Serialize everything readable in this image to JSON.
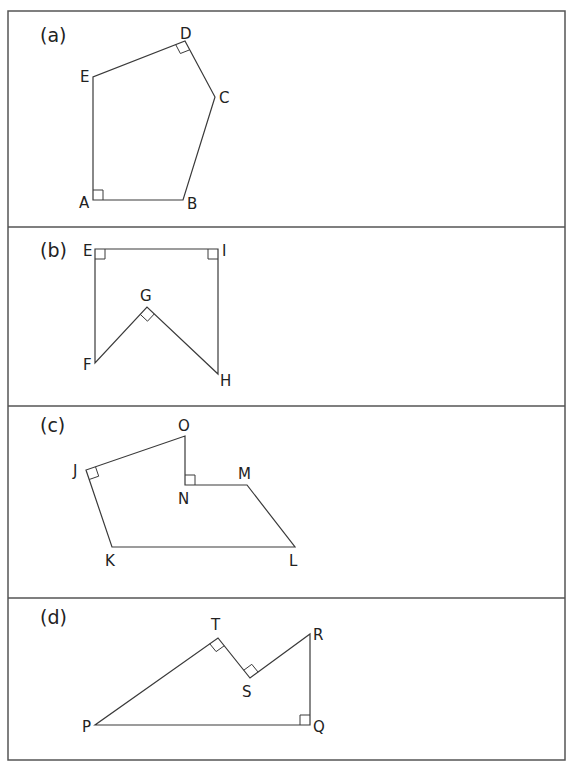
{
  "panels": [
    {
      "id": "a",
      "label": "(a)",
      "label_pos": [
        40,
        42
      ],
      "polygon": [
        [
          93,
          200
        ],
        [
          183,
          200
        ],
        [
          215,
          97
        ],
        [
          185,
          41
        ],
        [
          93,
          77
        ]
      ],
      "vertices": [
        {
          "name": "A",
          "x": 93,
          "y": 200,
          "lx": 79,
          "ly": 208
        },
        {
          "name": "B",
          "x": 183,
          "y": 200,
          "lx": 187,
          "ly": 209
        },
        {
          "name": "C",
          "x": 215,
          "y": 97,
          "lx": 219,
          "ly": 103
        },
        {
          "name": "D",
          "x": 185,
          "y": 41,
          "lx": 180,
          "ly": 39
        },
        {
          "name": "E",
          "x": 93,
          "y": 77,
          "lx": 80,
          "ly": 82
        }
      ],
      "right_angles": [
        "A",
        "D"
      ]
    },
    {
      "id": "b",
      "label": "(b)",
      "label_pos": [
        40,
        257
      ],
      "polygon": [
        [
          95,
          249
        ],
        [
          218,
          249
        ],
        [
          218,
          374
        ],
        [
          147,
          307
        ],
        [
          95,
          363
        ]
      ],
      "vertices": [
        {
          "name": "E",
          "x": 95,
          "y": 249,
          "lx": 83,
          "ly": 256
        },
        {
          "name": "I",
          "x": 218,
          "y": 249,
          "lx": 222,
          "ly": 256
        },
        {
          "name": "G",
          "x": 147,
          "y": 307,
          "lx": 140,
          "ly": 301
        },
        {
          "name": "F",
          "x": 95,
          "y": 363,
          "lx": 83,
          "ly": 370
        },
        {
          "name": "H",
          "x": 218,
          "y": 374,
          "lx": 220,
          "ly": 386
        }
      ],
      "right_angles": [
        "E",
        "I",
        "G"
      ]
    },
    {
      "id": "c",
      "label": "(c)",
      "label_pos": [
        40,
        432
      ],
      "polygon": [
        [
          185,
          436
        ],
        [
          185,
          485
        ],
        [
          247,
          485
        ],
        [
          295,
          547
        ],
        [
          112,
          547
        ],
        [
          86,
          470
        ]
      ],
      "vertices": [
        {
          "name": "O",
          "x": 185,
          "y": 436,
          "lx": 178,
          "ly": 431
        },
        {
          "name": "N",
          "x": 185,
          "y": 485,
          "lx": 178,
          "ly": 504
        },
        {
          "name": "M",
          "x": 247,
          "y": 485,
          "lx": 238,
          "ly": 479
        },
        {
          "name": "L",
          "x": 295,
          "y": 547,
          "lx": 289,
          "ly": 566
        },
        {
          "name": "K",
          "x": 112,
          "y": 547,
          "lx": 105,
          "ly": 566
        },
        {
          "name": "J",
          "x": 86,
          "y": 470,
          "lx": 73,
          "ly": 476
        }
      ],
      "right_angles": [
        "J",
        "N"
      ]
    },
    {
      "id": "d",
      "label": "(d)",
      "label_pos": [
        40,
        624
      ],
      "polygon": [
        [
          95,
          725
        ],
        [
          310,
          725
        ],
        [
          310,
          634
        ],
        [
          250,
          678
        ],
        [
          218,
          638
        ]
      ],
      "vertices": [
        {
          "name": "T",
          "x": 218,
          "y": 638,
          "lx": 211,
          "ly": 630
        },
        {
          "name": "S",
          "x": 250,
          "y": 678,
          "lx": 242,
          "ly": 697
        },
        {
          "name": "R",
          "x": 310,
          "y": 634,
          "lx": 313,
          "ly": 640
        },
        {
          "name": "Q",
          "x": 310,
          "y": 725,
          "lx": 313,
          "ly": 732
        },
        {
          "name": "P",
          "x": 95,
          "y": 725,
          "lx": 82,
          "ly": 732
        }
      ],
      "right_angles": [
        "T",
        "S",
        "Q"
      ]
    }
  ],
  "frame": {
    "x": 8,
    "y": 11,
    "width": 557,
    "height": 749
  },
  "dividers": [
    227,
    406,
    598
  ],
  "colors": {
    "line": "#3a3a3a",
    "frame": "#555555",
    "text": "#222222",
    "background": "#ffffff"
  }
}
